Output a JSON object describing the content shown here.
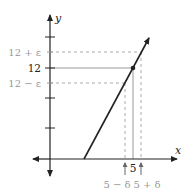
{
  "diagram": {
    "axes": {
      "x_label": "x",
      "y_label": "y"
    },
    "y_labels": {
      "upper": "12 + ε",
      "center": "12",
      "lower": "12 − ε"
    },
    "x_labels": {
      "left": "5 − δ",
      "center": "5",
      "right": "5 + δ"
    },
    "point": {
      "x": 5,
      "y": 12
    },
    "colors": {
      "axis": "#222222",
      "line": "#222222",
      "dashed": "#aaaaaa",
      "guide": "#888888",
      "muted_text": "#999999",
      "text": "#222222"
    }
  }
}
